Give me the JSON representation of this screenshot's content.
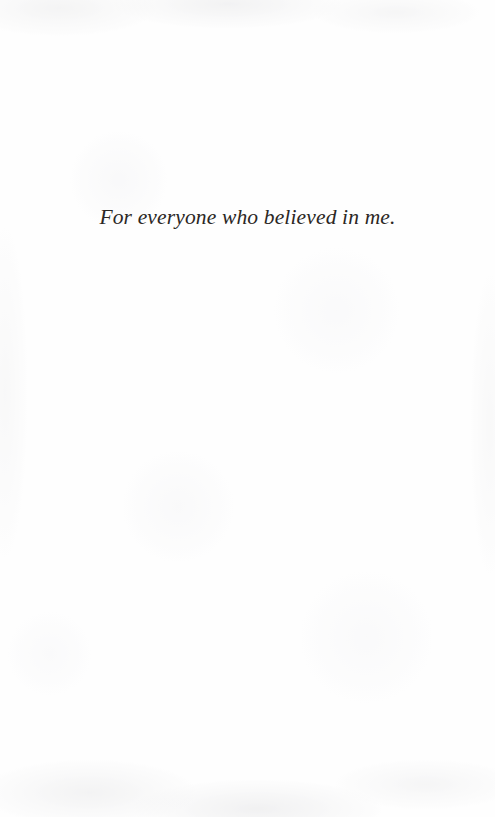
{
  "page": {
    "kind": "book-dedication-page",
    "background_color": "#fefefe",
    "ink_color": "#2b2724"
  },
  "dedication": {
    "text": "For everyone who believed in me."
  }
}
